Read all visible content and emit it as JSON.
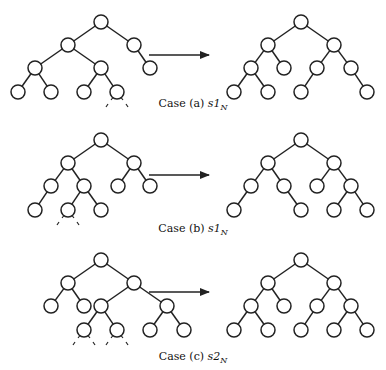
{
  "node_radius": 7,
  "colors": {
    "stroke": "#222222",
    "background": "#ffffff"
  },
  "cases": [
    {
      "id": "a",
      "caption": {
        "prefix": "Case (a)",
        "symbol": "s1",
        "subscript": "N"
      },
      "caption_y": 103,
      "arrow": {
        "x1": 149,
        "x2": 209,
        "y": 55
      },
      "before": {
        "nodes": [
          [
            101,
            22
          ],
          [
            68,
            45
          ],
          [
            134,
            45
          ],
          [
            35,
            68
          ],
          [
            101,
            68
          ],
          [
            150,
            68
          ],
          [
            18,
            92
          ],
          [
            51,
            92
          ],
          [
            84,
            92
          ],
          [
            117,
            92
          ]
        ],
        "edges": [
          [
            0,
            1
          ],
          [
            0,
            2
          ],
          [
            1,
            3
          ],
          [
            1,
            4
          ],
          [
            2,
            5
          ],
          [
            3,
            6
          ],
          [
            3,
            7
          ],
          [
            4,
            8
          ],
          [
            4,
            9
          ]
        ],
        "dashed_under": [
          9
        ]
      },
      "after": {
        "nodes": [
          [
            301,
            22
          ],
          [
            268,
            45
          ],
          [
            334,
            45
          ],
          [
            251,
            68
          ],
          [
            284,
            68
          ],
          [
            317,
            68
          ],
          [
            351,
            68
          ],
          [
            234,
            92
          ],
          [
            268,
            92
          ],
          [
            301,
            92
          ],
          [
            367,
            92
          ]
        ],
        "edges": [
          [
            0,
            1
          ],
          [
            0,
            2
          ],
          [
            1,
            3
          ],
          [
            1,
            4
          ],
          [
            2,
            5
          ],
          [
            2,
            6
          ],
          [
            3,
            7
          ],
          [
            3,
            8
          ],
          [
            5,
            9
          ],
          [
            6,
            10
          ]
        ],
        "dashed_under": []
      }
    },
    {
      "id": "b",
      "caption": {
        "prefix": "Case (b)",
        "symbol": "s1",
        "subscript": "N"
      },
      "caption_y": 228,
      "arrow": {
        "x1": 149,
        "x2": 209,
        "y": 175
      },
      "before": {
        "nodes": [
          [
            101,
            140
          ],
          [
            68,
            163
          ],
          [
            134,
            163
          ],
          [
            51,
            186
          ],
          [
            84,
            186
          ],
          [
            118,
            186
          ],
          [
            150,
            186
          ],
          [
            35,
            210
          ],
          [
            68,
            210
          ],
          [
            101,
            210
          ]
        ],
        "edges": [
          [
            0,
            1
          ],
          [
            0,
            2
          ],
          [
            1,
            3
          ],
          [
            1,
            4
          ],
          [
            2,
            5
          ],
          [
            2,
            6
          ],
          [
            3,
            7
          ],
          [
            4,
            8
          ],
          [
            4,
            9
          ]
        ],
        "dashed_under": [
          8
        ]
      },
      "after": {
        "nodes": [
          [
            301,
            140
          ],
          [
            268,
            163
          ],
          [
            334,
            163
          ],
          [
            251,
            186
          ],
          [
            284,
            186
          ],
          [
            317,
            186
          ],
          [
            351,
            186
          ],
          [
            234,
            210
          ],
          [
            301,
            210
          ],
          [
            334,
            210
          ],
          [
            367,
            210
          ]
        ],
        "edges": [
          [
            0,
            1
          ],
          [
            0,
            2
          ],
          [
            1,
            3
          ],
          [
            1,
            4
          ],
          [
            2,
            5
          ],
          [
            2,
            6
          ],
          [
            3,
            7
          ],
          [
            4,
            8
          ],
          [
            6,
            9
          ],
          [
            6,
            10
          ]
        ],
        "dashed_under": []
      }
    },
    {
      "id": "c",
      "caption": {
        "prefix": "Case (c)",
        "symbol": "s2",
        "subscript": "N"
      },
      "caption_y": 346,
      "arrow": {
        "x1": 149,
        "x2": 209,
        "y": 292
      },
      "before": {
        "nodes": [
          [
            101,
            260
          ],
          [
            68,
            283
          ],
          [
            134,
            283
          ],
          [
            51,
            306
          ],
          [
            84,
            306
          ],
          [
            101,
            306
          ],
          [
            167,
            306
          ],
          [
            84,
            330
          ],
          [
            117,
            330
          ],
          [
            150,
            330
          ],
          [
            184,
            330
          ]
        ],
        "edges": [
          [
            0,
            1
          ],
          [
            0,
            2
          ],
          [
            1,
            3
          ],
          [
            1,
            4
          ],
          [
            2,
            5
          ],
          [
            2,
            6
          ],
          [
            5,
            7
          ],
          [
            5,
            8
          ],
          [
            6,
            9
          ],
          [
            6,
            10
          ]
        ],
        "dashed_under": [
          7,
          8
        ]
      },
      "after": {
        "nodes": [
          [
            301,
            260
          ],
          [
            268,
            283
          ],
          [
            334,
            283
          ],
          [
            251,
            306
          ],
          [
            284,
            306
          ],
          [
            317,
            306
          ],
          [
            351,
            306
          ],
          [
            234,
            330
          ],
          [
            268,
            330
          ],
          [
            301,
            330
          ],
          [
            334,
            330
          ],
          [
            367,
            330
          ]
        ],
        "edges": [
          [
            0,
            1
          ],
          [
            0,
            2
          ],
          [
            1,
            3
          ],
          [
            1,
            4
          ],
          [
            2,
            5
          ],
          [
            2,
            6
          ],
          [
            3,
            7
          ],
          [
            3,
            8
          ],
          [
            5,
            9
          ],
          [
            6,
            10
          ],
          [
            6,
            11
          ]
        ],
        "dashed_under": []
      }
    }
  ]
}
